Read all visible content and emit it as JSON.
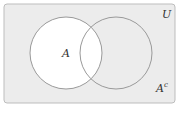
{
  "diagram": {
    "type": "venn",
    "universe_label": "U",
    "set_label": "A",
    "complement_label": "A",
    "complement_superscript": "c",
    "shaded_region": "complement of A",
    "colors": {
      "background": "#ffffff",
      "universe_fill": "#ececec",
      "set_fill": "#ffffff",
      "stroke": "#9a9a9a"
    }
  }
}
